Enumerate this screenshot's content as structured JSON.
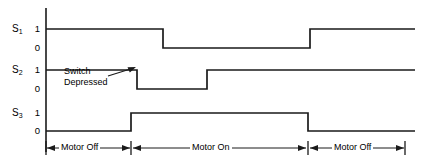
{
  "figure": {
    "type": "timing-diagram",
    "title": "",
    "width": 421,
    "height": 164,
    "line_color": "#1a1a1a",
    "background_color": "#ffffff"
  },
  "axis": {
    "vertical_line_x": 46,
    "vertical_line_top_y": 8,
    "vertical_line_bottom_y": 152,
    "signal_names": [
      "S1",
      "S2",
      "S3"
    ],
    "level_labels": [
      "1",
      "0"
    ]
  },
  "signals": [
    {
      "name": "S",
      "subscript": "1",
      "label_high": "1",
      "label_low": "0",
      "y_high": 29,
      "y_low": 48,
      "transitions": [
        {
          "x": 46,
          "level": 1
        },
        {
          "x": 163,
          "level": 0
        },
        {
          "x": 310,
          "level": 1
        },
        {
          "x": 415,
          "level": 1
        }
      ]
    },
    {
      "name": "S",
      "subscript": "2",
      "label_high": "1",
      "label_low": "0",
      "y_high": 70,
      "y_low": 89,
      "transitions": [
        {
          "x": 46,
          "level": 1
        },
        {
          "x": 137,
          "level": 0
        },
        {
          "x": 207,
          "level": 1
        },
        {
          "x": 415,
          "level": 1
        }
      ]
    },
    {
      "name": "S",
      "subscript": "3",
      "label_high": "1",
      "label_low": "0",
      "y_high": 113,
      "y_low": 131,
      "transitions": [
        {
          "x": 46,
          "level": 0
        },
        {
          "x": 131,
          "level": 1
        },
        {
          "x": 308,
          "level": 0
        },
        {
          "x": 415,
          "level": 0
        }
      ]
    }
  ],
  "annotation": {
    "line1": "Switch",
    "line2": "Depressed",
    "text_x": 68,
    "text_y": 66,
    "arrow_from_x": 108,
    "arrow_from_y": 76,
    "arrow_to_x": 134,
    "arrow_to_y": 68
  },
  "phases": {
    "axis_y": 148,
    "items": [
      {
        "label": "Motor Off",
        "x_start": 46,
        "x_end": 131
      },
      {
        "label": "Motor On",
        "x_start": 131,
        "x_end": 308
      },
      {
        "label": "Motor Off",
        "x_start": 308,
        "x_end": 405
      }
    ]
  },
  "chart_data": {
    "type": "line",
    "xlabel": "",
    "ylabel": "",
    "ylim": [
      0,
      1
    ],
    "grid": false,
    "legend": "none",
    "categories": [
      "Motor Off",
      "Motor On",
      "Motor Off"
    ],
    "series": [
      {
        "name": "S1",
        "values": [
          1,
          0,
          1
        ],
        "edges": [
          {
            "x_px": 46,
            "value": 1
          },
          {
            "x_px": 163,
            "value": 0
          },
          {
            "x_px": 310,
            "value": 1
          }
        ]
      },
      {
        "name": "S2",
        "values": [
          1,
          0,
          1
        ],
        "edges": [
          {
            "x_px": 46,
            "value": 1
          },
          {
            "x_px": 137,
            "value": 0
          },
          {
            "x_px": 207,
            "value": 1
          }
        ]
      },
      {
        "name": "S3",
        "values": [
          0,
          1,
          0
        ],
        "edges": [
          {
            "x_px": 46,
            "value": 0
          },
          {
            "x_px": 131,
            "value": 1
          },
          {
            "x_px": 308,
            "value": 0
          }
        ]
      }
    ],
    "annotations": [
      {
        "text": "Switch Depressed",
        "target_series": "S2",
        "target_x_px": 137
      }
    ]
  }
}
